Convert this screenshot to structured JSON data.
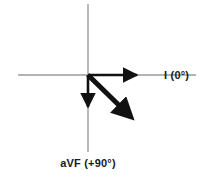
{
  "diagram": {
    "colors": {
      "axis_gray": "#9a9a9a",
      "vector_black": "#111111",
      "background": "#ffffff"
    },
    "origin": {
      "x": 88,
      "y": 75
    },
    "reference_axes": [
      {
        "name": "horizontal-reference-axis",
        "x1": 18,
        "y1": 75,
        "x2": 196,
        "y2": 75
      },
      {
        "name": "vertical-reference-axis",
        "x1": 88,
        "y1": 4,
        "x2": 88,
        "y2": 152
      }
    ],
    "vectors": [
      {
        "id": "lead-i",
        "label": "I (0°)",
        "angle_degrees": 0,
        "direction": "right",
        "x1": 88,
        "y1": 75,
        "x2": 142,
        "y2": 75,
        "stroke_width": 2.6
      },
      {
        "id": "lead-avf",
        "label": "aVF (+90°)",
        "angle_degrees": 90,
        "direction": "down",
        "x1": 88,
        "y1": 75,
        "x2": 88,
        "y2": 112,
        "stroke_width": 2.6
      },
      {
        "id": "mean-axis-vector",
        "label": "",
        "angle_degrees": 45,
        "direction": "down-right",
        "x1": 88,
        "y1": 75,
        "x2": 133,
        "y2": 119,
        "stroke_width": 5.0
      }
    ],
    "labels": [
      {
        "id": "label-lead-i",
        "text": "I (0°)",
        "x": 164,
        "y": 79,
        "anchor": "start"
      },
      {
        "id": "label-lead-avf",
        "text": "aVF (+90°)",
        "x": 88,
        "y": 167,
        "anchor": "middle"
      }
    ]
  }
}
